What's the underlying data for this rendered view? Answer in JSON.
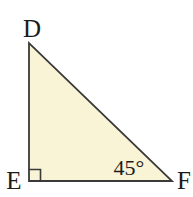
{
  "figure": {
    "type": "right-triangle-diagram",
    "vertices": [
      {
        "id": "D",
        "label": "D",
        "position": "top-left apex"
      },
      {
        "id": "E",
        "label": "E",
        "position": "bottom-left, right angle"
      },
      {
        "id": "F",
        "label": "F",
        "position": "bottom-right"
      }
    ],
    "angle": {
      "at_vertex": "F",
      "label": "45°",
      "value_degrees": 45
    },
    "right_angle_at": "E",
    "colors": {
      "background": "#ffffff",
      "triangle_fill": "#faf4d6",
      "stroke": "#3a3a3a",
      "label_text": "#1c1c1c"
    }
  }
}
